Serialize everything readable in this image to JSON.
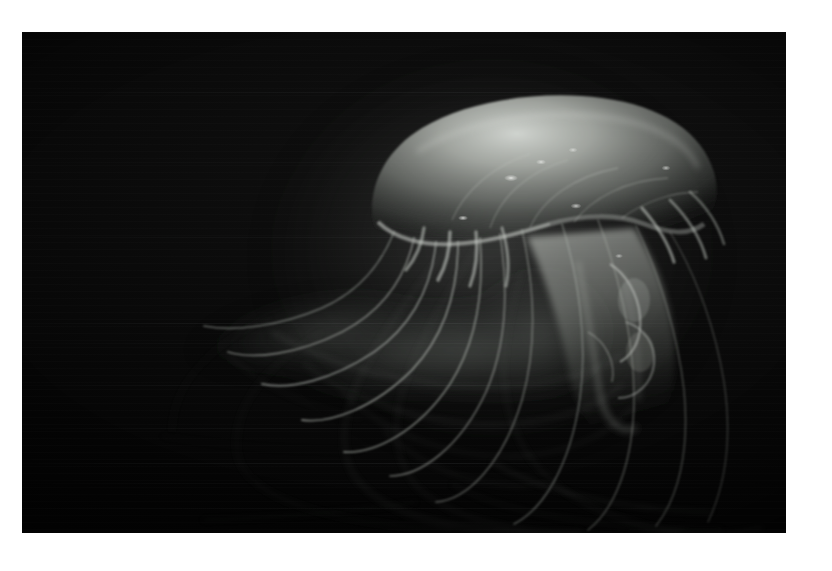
{
  "meta": {
    "domain": "Natural-Image",
    "canvas_width": 832,
    "canvas_height": 571,
    "page_background": "#ffffff"
  },
  "photo": {
    "name": "jellyfish-photograph",
    "left": 22,
    "top": 32,
    "width": 764,
    "height": 501,
    "background_color": "#050505",
    "subject": "jellyfish",
    "scene": "deep dark water",
    "caption": ""
  },
  "palette": {
    "page_white": "#ffffff",
    "water_deep": "#020202",
    "water_mid": "#0b0b0b",
    "water_light": "#121212",
    "bell_core": "#cfd3cf",
    "bell_mid": "#8d918c",
    "bell_edge": "#5a5e5a",
    "bell_rim_highlight": "#e8eae6",
    "tentacle_bright": "#b9bdb7",
    "tentacle_faint": "#4a4e4a",
    "veil_haze": "#3a3e3c",
    "oral_arm": "#a6aaa4",
    "spot_highlight": "#f2f4f0"
  },
  "subject_anatomy": {
    "bell": {
      "name": "jellyfish-bell",
      "center_x_pct": 67,
      "center_y_pct": 29,
      "width_pct": 42,
      "height_pct": 25,
      "description": "broad mushroom-shaped translucent dome, brightest along the upper-left crown"
    },
    "bell_margin": {
      "name": "bell-margin",
      "description": "scalloped lower rim of the dome where tentacles attach"
    },
    "oral_arms": {
      "name": "oral-arms",
      "description": "frilly luminous column hanging below and right of the bell"
    },
    "tentacles": {
      "name": "tentacles",
      "count_visible": 14,
      "description": "long fine filaments sweeping left then curving down to the lower right corner"
    },
    "veil": {
      "name": "tentacle-veil",
      "description": "diffuse glowing haze trailing to the left of the animal"
    },
    "highlight_spots": {
      "name": "bell-highlight-spots",
      "count": 7,
      "description": "small bright specular dots scattered on the bell surface"
    }
  },
  "lighting": {
    "key_direction": "upper-left",
    "contrast": "very high",
    "exposure": "low-key",
    "subject_luminance_peak": "#e8eae6",
    "background_luminance": "#050505"
  }
}
